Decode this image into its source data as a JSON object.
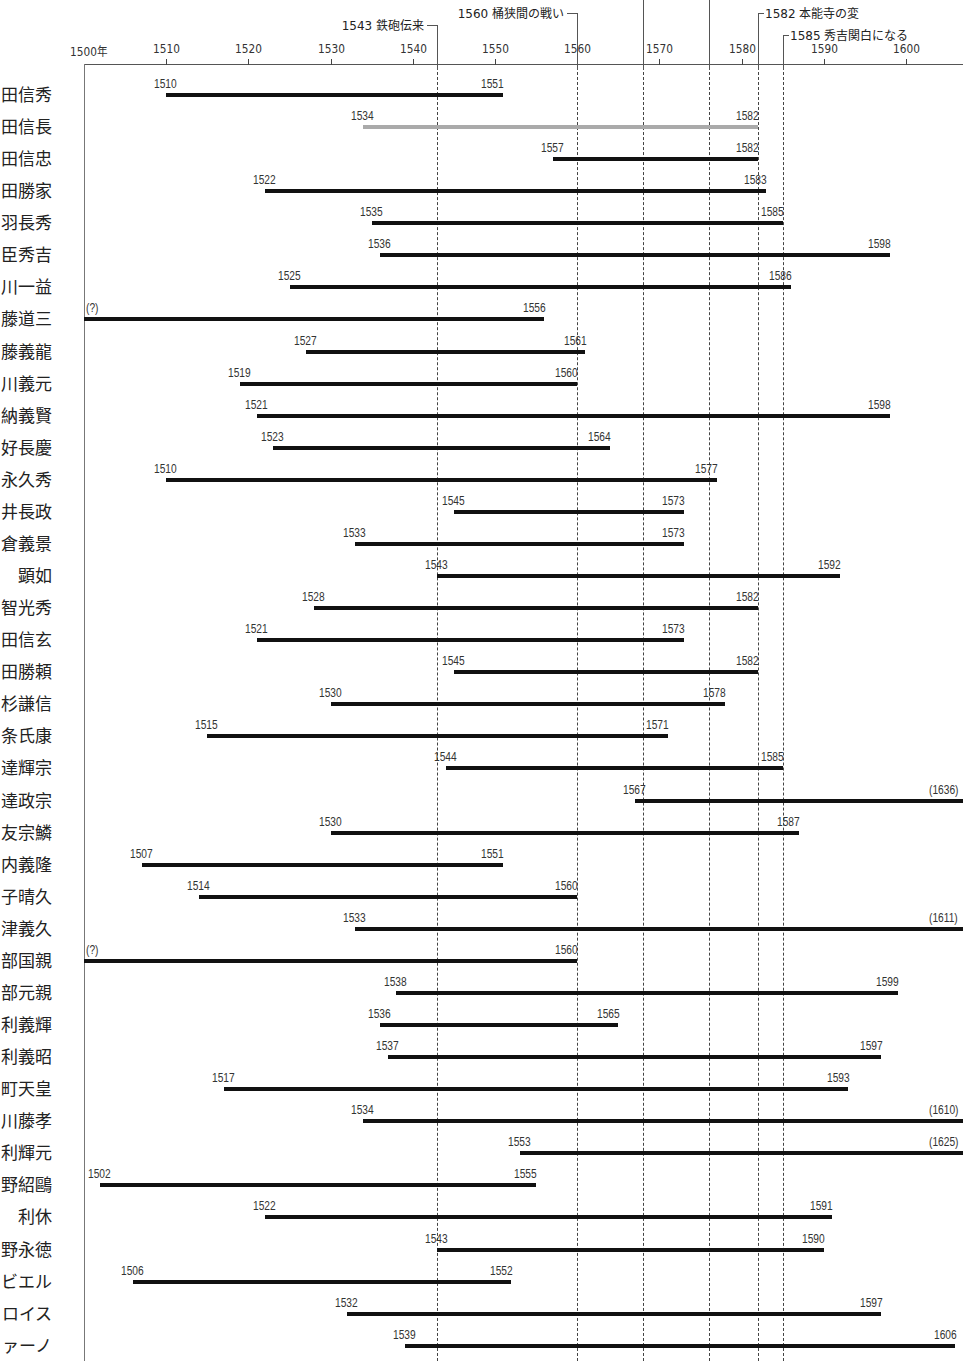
{
  "chart_data": {
    "type": "timeline",
    "title": "",
    "xlabel": "年",
    "xlim": [
      1500,
      1607
    ],
    "x_ticks": [
      "1500年",
      "1510",
      "1520",
      "1530",
      "1540",
      "1550",
      "1560",
      "1570",
      "1580",
      "1590",
      "1600"
    ],
    "x_tick_values": [
      1500,
      1510,
      1520,
      1530,
      1540,
      1550,
      1560,
      1570,
      1580,
      1590,
      1600
    ],
    "events": [
      {
        "year": 1543,
        "label": "1543 鉄砲伝来"
      },
      {
        "year": 1560,
        "label": "1560 桶狭間の戦い"
      },
      {
        "year": 1568,
        "label": ""
      },
      {
        "year": 1576,
        "label": ""
      },
      {
        "year": 1582,
        "label": "1582 本能寺の変"
      },
      {
        "year": 1585,
        "label": "1585 秀吉関白になる"
      }
    ],
    "rows": [
      {
        "name": "田信秀",
        "start": 1510,
        "end": 1551,
        "start_label": "1510",
        "end_label": "1551"
      },
      {
        "name": "田信長",
        "start": 1534,
        "end": 1582,
        "start_label": "1534",
        "end_label": "1582",
        "highlight": "gray"
      },
      {
        "name": "田信忠",
        "start": 1557,
        "end": 1582,
        "start_label": "1557",
        "end_label": "1582"
      },
      {
        "name": "田勝家",
        "start": 1522,
        "end": 1583,
        "start_label": "1522",
        "end_label": "1583"
      },
      {
        "name": "羽長秀",
        "start": 1535,
        "end": 1585,
        "start_label": "1535",
        "end_label": "1585"
      },
      {
        "name": "臣秀吉",
        "start": 1536,
        "end": 1598,
        "start_label": "1536",
        "end_label": "1598"
      },
      {
        "name": "川一益",
        "start": 1525,
        "end": 1586,
        "start_label": "1525",
        "end_label": "1586"
      },
      {
        "name": "藤道三",
        "start": 1500,
        "end": 1556,
        "start_label": "(?)",
        "end_label": "1556"
      },
      {
        "name": "藤義龍",
        "start": 1527,
        "end": 1561,
        "start_label": "1527",
        "end_label": "1561"
      },
      {
        "name": "川義元",
        "start": 1519,
        "end": 1560,
        "start_label": "1519",
        "end_label": "1560"
      },
      {
        "name": "納義賢",
        "start": 1521,
        "end": 1598,
        "start_label": "1521",
        "end_label": "1598"
      },
      {
        "name": "好長慶",
        "start": 1523,
        "end": 1564,
        "start_label": "1523",
        "end_label": "1564"
      },
      {
        "name": "永久秀",
        "start": 1510,
        "end": 1577,
        "start_label": "1510",
        "end_label": "1577"
      },
      {
        "name": "井長政",
        "start": 1545,
        "end": 1573,
        "start_label": "1545",
        "end_label": "1573"
      },
      {
        "name": "倉義景",
        "start": 1533,
        "end": 1573,
        "start_label": "1533",
        "end_label": "1573"
      },
      {
        "name": "顕如",
        "start": 1543,
        "end": 1592,
        "start_label": "1543",
        "end_label": "1592"
      },
      {
        "name": "智光秀",
        "start": 1528,
        "end": 1582,
        "start_label": "1528",
        "end_label": "1582"
      },
      {
        "name": "田信玄",
        "start": 1521,
        "end": 1573,
        "start_label": "1521",
        "end_label": "1573"
      },
      {
        "name": "田勝頼",
        "start": 1545,
        "end": 1582,
        "start_label": "1545",
        "end_label": "1582"
      },
      {
        "name": "杉謙信",
        "start": 1530,
        "end": 1578,
        "start_label": "1530",
        "end_label": "1578"
      },
      {
        "name": "条氏康",
        "start": 1515,
        "end": 1571,
        "start_label": "1515",
        "end_label": "1571"
      },
      {
        "name": "達輝宗",
        "start": 1544,
        "end": 1585,
        "start_label": "1544",
        "end_label": "1585"
      },
      {
        "name": "達政宗",
        "start": 1567,
        "end": 1607,
        "start_label": "1567",
        "end_label": "(1636)"
      },
      {
        "name": "友宗鱗",
        "start": 1530,
        "end": 1587,
        "start_label": "1530",
        "end_label": "1587"
      },
      {
        "name": "内義隆",
        "start": 1507,
        "end": 1551,
        "start_label": "1507",
        "end_label": "1551"
      },
      {
        "name": "子晴久",
        "start": 1514,
        "end": 1560,
        "start_label": "1514",
        "end_label": "1560"
      },
      {
        "name": "津義久",
        "start": 1533,
        "end": 1607,
        "start_label": "1533",
        "end_label": "(1611)"
      },
      {
        "name": "部国親",
        "start": 1500,
        "end": 1560,
        "start_label": "(?)",
        "end_label": "1560"
      },
      {
        "name": "部元親",
        "start": 1538,
        "end": 1599,
        "start_label": "1538",
        "end_label": "1599"
      },
      {
        "name": "利義輝",
        "start": 1536,
        "end": 1565,
        "start_label": "1536",
        "end_label": "1565"
      },
      {
        "name": "利義昭",
        "start": 1537,
        "end": 1597,
        "start_label": "1537",
        "end_label": "1597"
      },
      {
        "name": "町天皇",
        "start": 1517,
        "end": 1593,
        "start_label": "1517",
        "end_label": "1593"
      },
      {
        "name": "川藤孝",
        "start": 1534,
        "end": 1607,
        "start_label": "1534",
        "end_label": "(1610)"
      },
      {
        "name": "利輝元",
        "start": 1553,
        "end": 1607,
        "start_label": "1553",
        "end_label": "(1625)"
      },
      {
        "name": "野紹鷗",
        "start": 1502,
        "end": 1555,
        "start_label": "1502",
        "end_label": "1555"
      },
      {
        "name": "利休",
        "start": 1522,
        "end": 1591,
        "start_label": "1522",
        "end_label": "1591"
      },
      {
        "name": "野永徳",
        "start": 1543,
        "end": 1590,
        "start_label": "1543",
        "end_label": "1590"
      },
      {
        "name": "ビエル",
        "start": 1506,
        "end": 1552,
        "start_label": "1506",
        "end_label": "1552"
      },
      {
        "name": "ロイス",
        "start": 1532,
        "end": 1597,
        "start_label": "1532",
        "end_label": "1597"
      },
      {
        "name": "ァーノ",
        "start": 1539,
        "end": 1606,
        "start_label": "1539",
        "end_label": "1606"
      }
    ],
    "grid": false,
    "legend": "none"
  }
}
